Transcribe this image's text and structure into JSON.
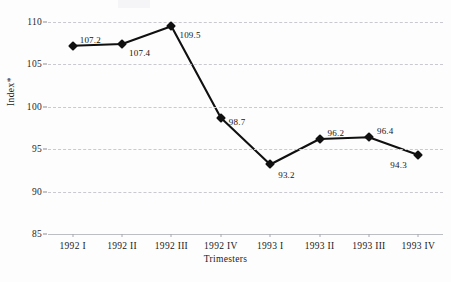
{
  "chart_data": {
    "type": "line",
    "title": "",
    "xlabel": "Trimesters",
    "ylabel": "Index*",
    "categories": [
      "1992 I",
      "1992 II",
      "1992 III",
      "1992 IV",
      "1993 I",
      "1993 II",
      "1993 III",
      "1993 IV"
    ],
    "values": [
      107.2,
      107.4,
      109.5,
      98.7,
      93.2,
      96.2,
      96.4,
      94.3
    ],
    "point_labels": [
      "107.2",
      "107.4",
      "109.5",
      "98.7",
      "93.2",
      "96.2",
      "96.4",
      "94.3"
    ],
    "ylim": [
      85,
      110
    ],
    "yticks": [
      110,
      105,
      100,
      95,
      90,
      85
    ],
    "ytick_labels": [
      "110",
      "105",
      "100",
      "95",
      "90",
      "85"
    ],
    "grid": true,
    "legend": "none",
    "series": [
      {
        "name": "Index",
        "values": [
          107.2,
          107.4,
          109.5,
          98.7,
          93.2,
          96.2,
          96.4,
          94.3
        ],
        "marker": "diamond",
        "color": "#101010"
      }
    ],
    "colors": {
      "line": "#101010",
      "marker": "#101010",
      "grid": "#c9c9cf",
      "axis": "#bdbdc4",
      "text": "#1a1a1a",
      "background": "#fdfdfd"
    }
  }
}
